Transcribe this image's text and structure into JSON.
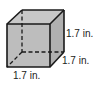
{
  "figure": {
    "type": "cube",
    "face_color": "#bdbdbd",
    "edge_color": "#1a1a1a",
    "labels": {
      "height": "1.7 in.",
      "depth": "1.7 in.",
      "width": "1.7 in."
    }
  }
}
